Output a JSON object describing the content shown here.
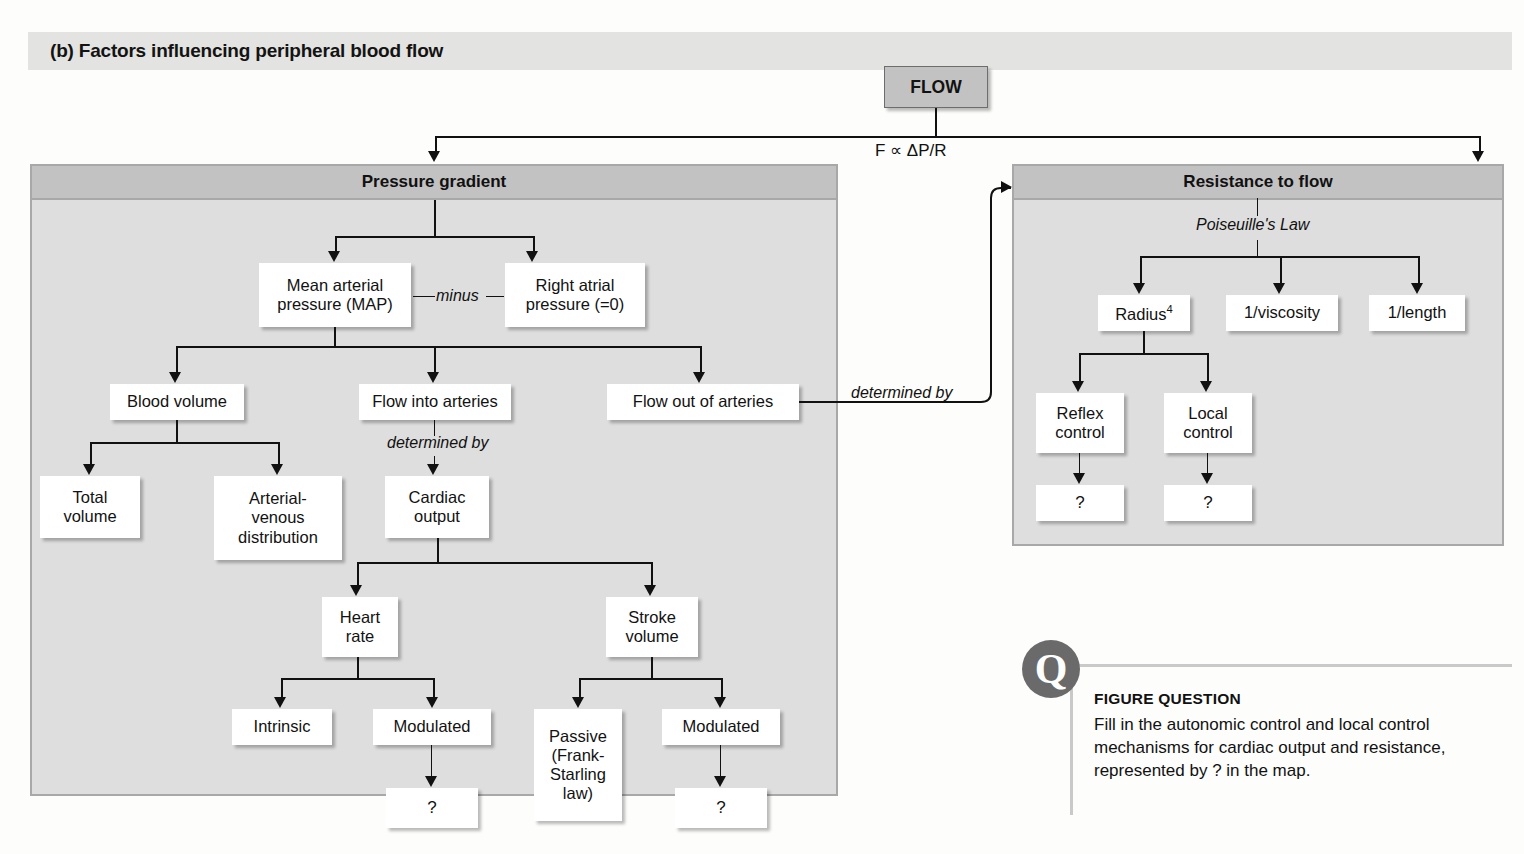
{
  "header": {
    "label": "(b) Factors influencing peripheral blood flow"
  },
  "root": {
    "label": "FLOW",
    "formula": "F ∝ ΔP/R"
  },
  "panels": {
    "pressure": {
      "title": "Pressure gradient"
    },
    "resistance": {
      "title": "Resistance to flow",
      "subtitle": "Poiseuille's Law"
    }
  },
  "connector_labels": {
    "minus": "minus",
    "determined_by_cardiac": "determined by",
    "determined_by_resistance": "determined by"
  },
  "nodes": {
    "mean_arterial_pressure": "Mean arterial\npressure (MAP)",
    "right_atrial_pressure": "Right atrial\npressure (=0)",
    "blood_volume": "Blood volume",
    "flow_into_arteries": "Flow into arteries",
    "flow_out_of_arteries": "Flow out of arteries",
    "total_volume": "Total\nvolume",
    "arterial_venous_distribution": "Arterial-\nvenous\ndistribution",
    "cardiac_output": "Cardiac\noutput",
    "heart_rate": "Heart\nrate",
    "stroke_volume": "Stroke\nvolume",
    "intrinsic": "Intrinsic",
    "modulated_hr": "Modulated",
    "passive_frank_starling": "Passive\n(Frank-\nStarling\nlaw)",
    "modulated_sv": "Modulated",
    "question_hr": "?",
    "question_sv": "?",
    "radius": "Radius",
    "radius_exponent": "4",
    "inverse_viscosity": "1/viscosity",
    "inverse_length": "1/length",
    "reflex_control": "Reflex\ncontrol",
    "local_control": "Local\ncontrol",
    "question_reflex": "?",
    "question_local": "?"
  },
  "figure_question": {
    "icon_glyph": "Q",
    "title": "FIGURE QUESTION",
    "body": "Fill in the autonomic control and local control mechanisms for cardiac output and resistance, represented by ? in the map."
  },
  "colors": {
    "panel_body": "#dedede",
    "panel_header": "#c2c2c2",
    "panel_border": "#a8a8a8",
    "node_bg": "#ffffff",
    "root_bg": "#c2c2c2",
    "line": "#111111",
    "banner_bg": "#e3e3e1",
    "q_icon_bg": "#6a6a6a"
  }
}
